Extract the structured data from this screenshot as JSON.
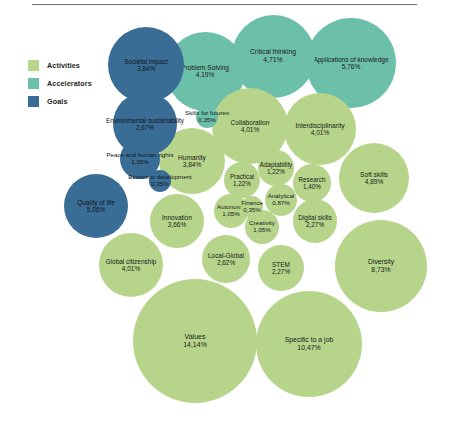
{
  "legend": {
    "items": [
      {
        "label": "Activities",
        "color": "#b6d48a",
        "key": "activities"
      },
      {
        "label": "Accelerators",
        "color": "#6cbfa8",
        "key": "accelerators"
      },
      {
        "label": "Goals",
        "color": "#3a6d96",
        "key": "goals"
      }
    ]
  },
  "colors": {
    "activities": "#b6d48a",
    "accelerators": "#6cbfa8",
    "goals": "#3a6d96",
    "rule": "#6d6e71",
    "text": "#1b1b1b"
  },
  "chart_data": {
    "type": "bubble",
    "title": "",
    "xlabel": "",
    "ylabel": "",
    "value_unit": "%",
    "decimal_separator": ",",
    "legend_position": "left",
    "grid": false,
    "categories": [
      "Activities",
      "Accelerators",
      "Goals"
    ],
    "bubbles": [
      {
        "label": "Societal impact",
        "value": 3.84,
        "value_text": "3,84%",
        "category": "Goals",
        "cx": 146,
        "cy": 65,
        "r": 38,
        "font": 6.4
      },
      {
        "label": "Problem Solving",
        "value": 4.19,
        "value_text": "4,19%",
        "category": "Accelerators",
        "cx": 205,
        "cy": 71,
        "r": 39.5,
        "font": 6.6
      },
      {
        "label": "Critical thinking",
        "value": 4.71,
        "value_text": "4,71%",
        "category": "Accelerators",
        "cx": 273,
        "cy": 56,
        "r": 41.5,
        "font": 6.8
      },
      {
        "label": "Applications of knowledge",
        "value": 5.76,
        "value_text": "5,76%",
        "category": "Accelerators",
        "cx": 351,
        "cy": 63,
        "r": 45,
        "font": 6.5
      },
      {
        "label": "Environmental sustainability",
        "value": 2.67,
        "value_text": "2,67%",
        "category": "Goals",
        "cx": 145,
        "cy": 124,
        "r": 32,
        "font": 6.3
      },
      {
        "label": "Skills for futures",
        "value": 0.35,
        "value_text": "0,35%",
        "category": "Accelerators",
        "cx": 207,
        "cy": 117,
        "r": 11,
        "font": 6.2
      },
      {
        "label": "Collaboration",
        "value": 4.01,
        "value_text": "4,01%",
        "category": "Activities",
        "cx": 250,
        "cy": 126,
        "r": 38,
        "font": 6.6
      },
      {
        "label": "Interdisciplinarity",
        "value": 4.01,
        "value_text": "4,01%",
        "category": "Activities",
        "cx": 320,
        "cy": 129,
        "r": 36,
        "font": 6.6
      },
      {
        "label": "Peace and human rights",
        "value": 1.05,
        "value_text": "1,05%",
        "category": "Goals",
        "cx": 140,
        "cy": 159,
        "r": 20,
        "font": 6.2
      },
      {
        "label": "Humanity",
        "value": 3.84,
        "value_text": "3,84%",
        "category": "Activities",
        "cx": 192,
        "cy": 161,
        "r": 33,
        "font": 6.6
      },
      {
        "label": "Economic development",
        "value": 0.35,
        "value_text": "0,35%",
        "category": "Goals",
        "cx": 160,
        "cy": 181,
        "r": 11,
        "font": 6.1
      },
      {
        "label": "Practical",
        "value": 1.22,
        "value_text": "1,22%",
        "category": "Activities",
        "cx": 242,
        "cy": 180,
        "r": 18,
        "font": 6.3
      },
      {
        "label": "Adaptability",
        "value": 1.22,
        "value_text": "1,22%",
        "category": "Activities",
        "cx": 276,
        "cy": 168,
        "r": 18,
        "font": 6.3
      },
      {
        "label": "Research",
        "value": 1.4,
        "value_text": "1,40%",
        "category": "Activities",
        "cx": 312,
        "cy": 183,
        "r": 19,
        "font": 6.3
      },
      {
        "label": "Soft skills",
        "value": 4.89,
        "value_text": "4,89%",
        "category": "Activities",
        "cx": 374,
        "cy": 178,
        "r": 35,
        "font": 6.6
      },
      {
        "label": "Quality of life",
        "value": 5.06,
        "value_text": "5,06%",
        "category": "Goals",
        "cx": 96,
        "cy": 206,
        "r": 32,
        "font": 6.5
      },
      {
        "label": "Finance",
        "value": 0.35,
        "value_text": "0,35%",
        "category": "Activities",
        "cx": 252,
        "cy": 207,
        "r": 11,
        "font": 6.1
      },
      {
        "label": "Analytical",
        "value": 0.87,
        "value_text": "0,87%",
        "category": "Activities",
        "cx": 281,
        "cy": 200,
        "r": 16,
        "font": 6.2
      },
      {
        "label": "Autonomy",
        "value": 1.05,
        "value_text": "1,05%",
        "category": "Activities",
        "cx": 231,
        "cy": 211,
        "r": 17,
        "font": 6.2
      },
      {
        "label": "Creativity",
        "value": 1.05,
        "value_text": "1,05%",
        "category": "Activities",
        "cx": 262,
        "cy": 227,
        "r": 17,
        "font": 6.2
      },
      {
        "label": "Digital skills",
        "value": 2.27,
        "value_text": "2,27%",
        "category": "Activities",
        "cx": 315,
        "cy": 221,
        "r": 22,
        "font": 6.4
      },
      {
        "label": "Innovation",
        "value": 3.66,
        "value_text": "3,66%",
        "category": "Activities",
        "cx": 177,
        "cy": 221,
        "r": 27,
        "font": 6.5
      },
      {
        "label": "Global citizenship",
        "value": 4.01,
        "value_text": "4,01%",
        "category": "Activities",
        "cx": 131,
        "cy": 265,
        "r": 32,
        "font": 6.5
      },
      {
        "label": "Local-Global",
        "value": 2.62,
        "value_text": "2,62%",
        "category": "Activities",
        "cx": 226,
        "cy": 259,
        "r": 24,
        "font": 6.4
      },
      {
        "label": "STEM",
        "value": 2.27,
        "value_text": "2,27%",
        "category": "Activities",
        "cx": 281,
        "cy": 268,
        "r": 23,
        "font": 6.4
      },
      {
        "label": "Diversity",
        "value": 8.73,
        "value_text": "8,73%",
        "category": "Activities",
        "cx": 381,
        "cy": 266,
        "r": 46,
        "font": 6.8
      },
      {
        "label": "Values",
        "value": 14.14,
        "value_text": "14,14%",
        "category": "Activities",
        "cx": 195,
        "cy": 341,
        "r": 62,
        "font": 7.0
      },
      {
        "label": "Specific to a job",
        "value": 10.47,
        "value_text": "10,47%",
        "category": "Activities",
        "cx": 309,
        "cy": 344,
        "r": 53,
        "font": 6.9
      }
    ]
  }
}
